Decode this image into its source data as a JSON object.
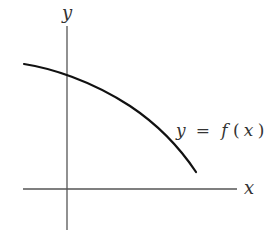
{
  "figure": {
    "axes": {
      "x_label": "x",
      "y_label": "y"
    },
    "curve": {
      "label_lhs": "y",
      "label_eq": "=",
      "label_fn": "f",
      "label_open": "(",
      "label_arg": "x",
      "label_close": ")",
      "description": "decreasing, concave-down curve crossing the positive y-axis"
    },
    "colors": {
      "axis": "#555555",
      "curve": "#111111",
      "text": "#333333",
      "background": "#ffffff"
    }
  }
}
